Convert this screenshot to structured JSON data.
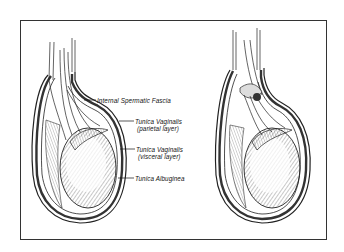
{
  "figure": {
    "labels": [
      {
        "id": "internal-spermatic-fascia",
        "line1": "Internal Spermatic Fascia",
        "line2": ""
      },
      {
        "id": "tunica-vaginalis-parietal",
        "line1": "Tunica Vaginalis",
        "line2": "(parietal layer)"
      },
      {
        "id": "tunica-vaginalis-visceral",
        "line1": "Tunica Vaginalis",
        "line2": "(visceral layer)"
      },
      {
        "id": "tunica-albuginea",
        "line1": "Tunica Albuginea",
        "line2": ""
      }
    ],
    "views": [
      {
        "id": "left-view",
        "description": "normal anatomy"
      },
      {
        "id": "right-view",
        "description": "twisted spermatic cord"
      }
    ]
  }
}
